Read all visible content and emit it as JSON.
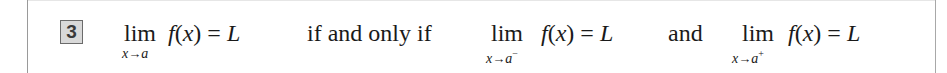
{
  "equation_number": "3",
  "lhs": {
    "lim": "lim",
    "sub_var": "x",
    "sub_arrow": "→",
    "sub_target": "a",
    "sub_sign": "",
    "func": "f",
    "arg_open": "(",
    "arg": "x",
    "arg_close": ")",
    "equals": " = ",
    "result": "L"
  },
  "connector_1": "if and only if",
  "left_limit": {
    "lim": "lim",
    "sub_var": "x",
    "sub_arrow": "→",
    "sub_target": "a",
    "sub_sign": "−",
    "func": "f",
    "arg_open": "(",
    "arg": "x",
    "arg_close": ")",
    "equals": " = ",
    "result": "L"
  },
  "connector_2": "and",
  "right_limit": {
    "lim": "lim",
    "sub_var": "x",
    "sub_arrow": "→",
    "sub_target": "a",
    "sub_sign": "+",
    "func": "f",
    "arg_open": "(",
    "arg": "x",
    "arg_close": ")",
    "equals": " = ",
    "result": "L"
  }
}
